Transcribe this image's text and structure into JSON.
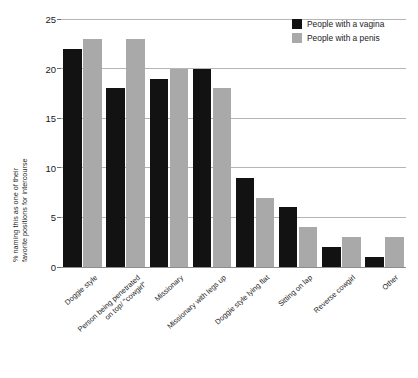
{
  "chart_data": {
    "type": "bar",
    "title": "",
    "subtitle": "",
    "xlabel": "",
    "ylabel_line1": "% naming this as one of their",
    "ylabel_line2": "favorite positions for intercourse",
    "ylabel": "% naming this as one of their favorite positions for intercourse",
    "ylim": [
      0,
      25
    ],
    "yticks": [
      0,
      5,
      10,
      15,
      20,
      25
    ],
    "ytick_labels": [
      "0",
      "5",
      "10",
      "15",
      "20",
      "25"
    ],
    "grid": "horizontal",
    "legend_position": "top-right",
    "categories": [
      "Doggie style",
      "Person being penetrated on top/ \"cowgirl\"",
      "Missionary",
      "Missionary with legs up",
      "Doggie style lying flat",
      "Sitting on lap",
      "Reverse cowgirl",
      "Other"
    ],
    "category_lines": [
      [
        "Doggie style"
      ],
      [
        "Person being penetrated",
        "on top/ \"cowgirl\""
      ],
      [
        "Missionary"
      ],
      [
        "Missionary with legs up"
      ],
      [
        "Doggie style lying flat"
      ],
      [
        "Sitting on lap"
      ],
      [
        "Reverse cowgirl"
      ],
      [
        "Other"
      ]
    ],
    "series": [
      {
        "name": "People with a vagina",
        "color": "#121212",
        "values": [
          22,
          18,
          19,
          20,
          9,
          6,
          2,
          1
        ]
      },
      {
        "name": "People with a penis",
        "color": "#a9a9a9",
        "values": [
          23,
          23,
          20,
          18,
          7,
          4,
          3,
          3
        ]
      }
    ]
  },
  "legend": {
    "items": [
      {
        "label": "People with a vagina",
        "color": "#121212"
      },
      {
        "label": "People with a penis",
        "color": "#a9a9a9"
      }
    ]
  },
  "colors": {
    "series_vagina": "#121212",
    "series_penis": "#a9a9a9",
    "gridline": "#b5b5b5",
    "axis": "#8d8d8d",
    "text": "#1a1a1a",
    "background": "#ffffff"
  }
}
